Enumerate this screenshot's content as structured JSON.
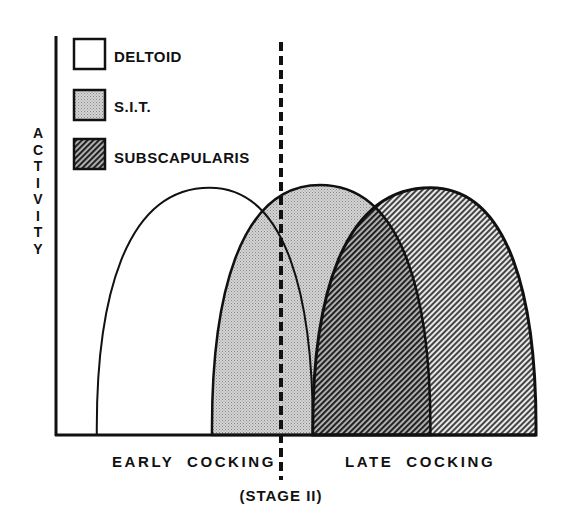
{
  "chart_data": {
    "type": "area",
    "title": "",
    "ylabel": "ACTIVITY",
    "xlabel": "",
    "x_range": [
      0,
      100
    ],
    "y_range": [
      0,
      100
    ],
    "grid": false,
    "legend_placement": "top-left",
    "phases": [
      {
        "label": "EARLY COCKING",
        "x_start": 0,
        "x_end": 47
      },
      {
        "label": "LATE COCKING",
        "x_start": 47,
        "x_end": 100
      }
    ],
    "divider": {
      "label": "(STAGE II)",
      "x": 47,
      "style": "dashed"
    },
    "series": [
      {
        "name": "DELTOID",
        "fill": "white",
        "x_start": 8.5,
        "x_peak": 32,
        "x_end": 53.5,
        "peak": 97
      },
      {
        "name": "S.I.T.",
        "fill": "stipple",
        "x_start": 32.5,
        "x_peak": 55,
        "x_end": 78,
        "peak": 98
      },
      {
        "name": "SUBSCAPULARIS",
        "fill": "hatch",
        "x_start": 53.5,
        "x_peak": 78,
        "x_end": 100,
        "peak": 97
      }
    ]
  },
  "legend": [
    {
      "label": "DELTOID",
      "fill": "white"
    },
    {
      "label": "S.I.T.",
      "fill": "stipple"
    },
    {
      "label": "SUBSCAPULARIS",
      "fill": "hatch"
    }
  ],
  "colors": {
    "ink": "#111111",
    "stipple": "#c8c8c8",
    "paper": "#ffffff"
  }
}
